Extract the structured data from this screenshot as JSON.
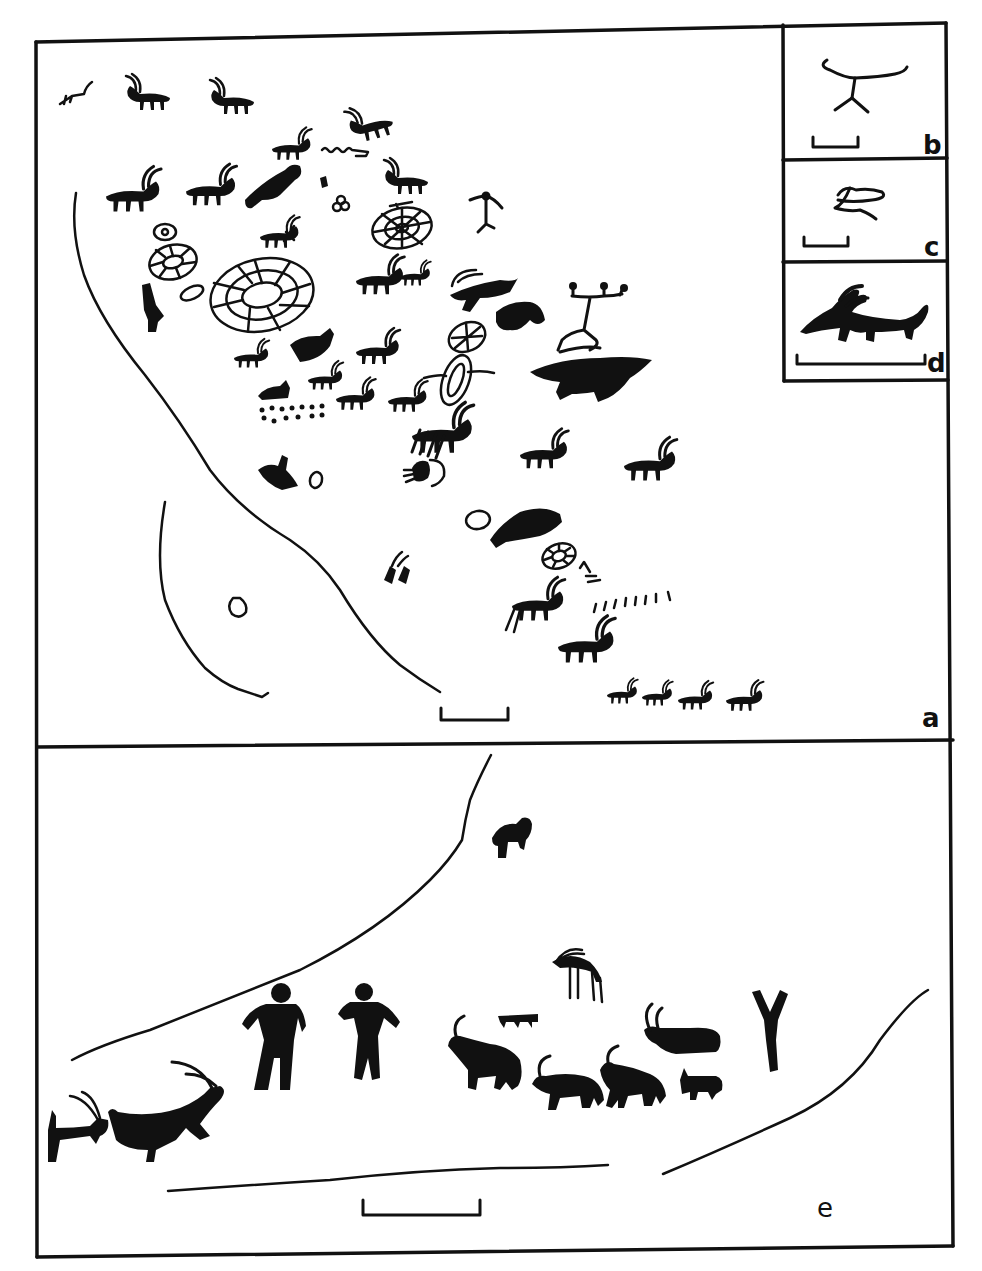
{
  "figure": {
    "type": "petroglyph tracing plate",
    "ink_color": "#111111",
    "background_color": "#ffffff",
    "panels": [
      {
        "id": "a",
        "label": "a",
        "description": "Large rock panel with many horned quadrupeds (ibex/goats), concentric and segmented oval/wheel motifs, anthropomorph, dotted rows, scale bar"
      },
      {
        "id": "b",
        "label": "b",
        "description": "Inset: linear anthropomorphic figure with outstretched arms, scale bar"
      },
      {
        "id": "c",
        "label": "c",
        "description": "Inset: small looped sign, scale bar"
      },
      {
        "id": "d",
        "label": "d",
        "description": "Inset: solid horned quadruped (ibex) with long tail, scale bar"
      },
      {
        "id": "e",
        "label": "e",
        "description": "Lower panel: row of solid human figures and horned quadrupeds along rock edge lines, small animal above, scale bar"
      }
    ]
  },
  "labels": {
    "a": "a",
    "b": "b",
    "c": "c",
    "d": "d",
    "e": "e"
  }
}
